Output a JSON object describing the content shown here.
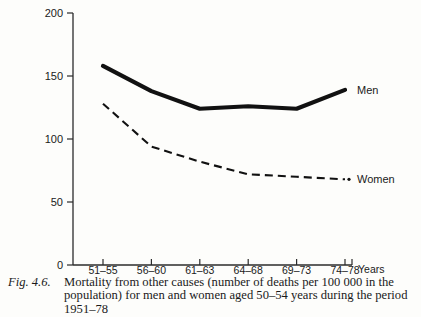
{
  "figure": {
    "number_label": "Fig. 4.6.",
    "caption_lines": [
      "Mortality from other causes (number of deaths per 100 000 in the",
      "population) for men and women aged 50–54 years during the period",
      "1951–78"
    ]
  },
  "chart_data": {
    "type": "line",
    "title": "",
    "subtitle": "",
    "xlabel": "Years",
    "ylabel": "",
    "categories": [
      "51–55",
      "56–60",
      "61–63",
      "64–68",
      "69–73",
      "74–78"
    ],
    "xtick_labels": [
      "51–55",
      "56–60",
      "61–63",
      "64–68",
      "69–73",
      "74–78"
    ],
    "x_axis_unit_label": "Years",
    "ylim": [
      0,
      200
    ],
    "ytick_labels": [
      "0",
      "50",
      "100",
      "150",
      "200"
    ],
    "ytick_values": [
      0,
      50,
      100,
      150,
      200
    ],
    "grid": false,
    "legend_position": "inline-right",
    "series": [
      {
        "name": "Men",
        "label": "Men",
        "style": "solid-thick",
        "color": "#111111",
        "values": [
          158,
          138,
          124,
          126,
          124,
          139
        ]
      },
      {
        "name": "Women",
        "label": "Women",
        "style": "dashed",
        "color": "#111111",
        "values": [
          128,
          94,
          82,
          72,
          70,
          68
        ]
      }
    ],
    "annotations": [
      {
        "text": "Men",
        "series": "Men",
        "position": "end-right"
      },
      {
        "text": "Women",
        "series": "Women",
        "position": "end-right"
      }
    ]
  }
}
